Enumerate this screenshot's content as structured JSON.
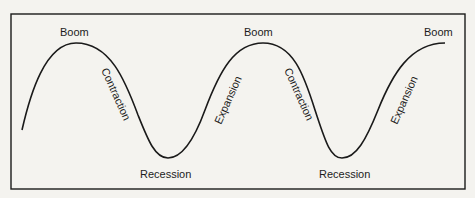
{
  "diagram": {
    "colors": {
      "background": "#f4f3ef",
      "stroke": "#1a1a1a",
      "text": "#1c1c1c"
    },
    "phases": {
      "peak_1": "Boom",
      "contraction_1": "Contraction",
      "trough_1": "Recession",
      "expansion_1": "Expansion",
      "peak_2": "Boom",
      "contraction_2": "Contraction",
      "trough_2": "Recession",
      "expansion_2": "Expansion",
      "peak_3": "Boom"
    },
    "sequence": [
      "Boom",
      "Contraction",
      "Recession",
      "Expansion",
      "Boom",
      "Contraction",
      "Recession",
      "Expansion",
      "Boom"
    ]
  }
}
